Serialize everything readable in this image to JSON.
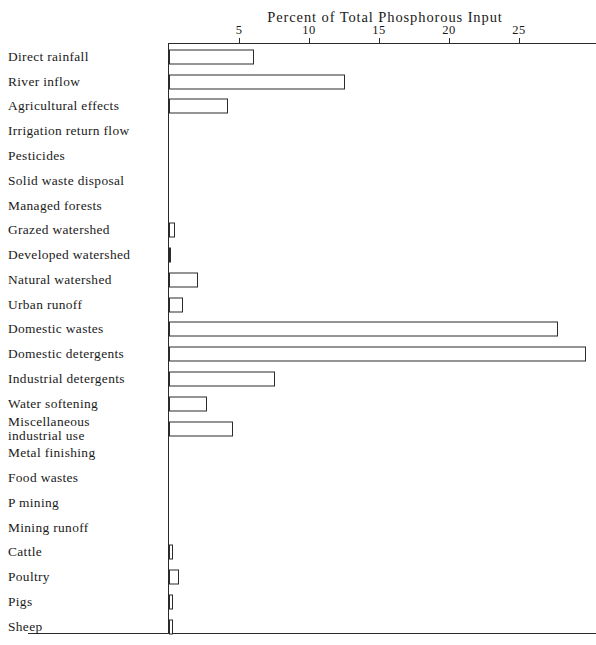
{
  "top_partial_text": "",
  "chart_data": {
    "type": "bar",
    "orientation": "horizontal",
    "title": "Percent of Total Phosphorous Input",
    "xlabel": "Percent of Total Phosphorous Input",
    "ylabel": "",
    "xlim": [
      0,
      29.5
    ],
    "grid": false,
    "legend": null,
    "xticks": [
      5,
      10,
      15,
      20,
      25
    ],
    "xtick_labels": [
      "5",
      "10",
      "15",
      "20",
      "25"
    ],
    "categories": [
      "Direct rainfall",
      "River inflow",
      "Agricultural effects",
      "Irrigation return flow",
      "Pesticides",
      "Solid waste disposal",
      "Managed forests",
      "Grazed watershed",
      "Developed watershed",
      "Natural watershed",
      "Urban runoff",
      "Domestic wastes",
      "Domestic detergents",
      "Industrial detergents",
      "Water softening",
      "Miscellaneous\n  industrial use",
      "Metal finishing",
      "Food wastes",
      "P mining",
      "Mining runoff",
      "Cattle",
      "Poultry",
      "Pigs",
      "Sheep"
    ],
    "values": [
      6.1,
      12.6,
      4.2,
      0,
      0,
      0,
      0,
      0.4,
      0.15,
      2.1,
      1.0,
      27.8,
      29.8,
      7.6,
      2.7,
      4.6,
      0,
      0,
      0,
      0,
      0.25,
      0.7,
      0.25,
      0.25
    ]
  },
  "colors": {
    "axis": "#2a2a2a",
    "bar_border": "#2b2b2b",
    "bar_fill": "#ffffff",
    "background": "#ffffff",
    "text": "#1a1a1a"
  }
}
